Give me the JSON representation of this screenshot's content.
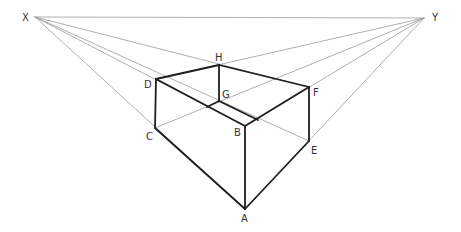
{
  "colors": {
    "construction": "#9a9a9a",
    "edge": "#1e1e1e",
    "label": "#333333"
  },
  "points": {
    "X": [
      35,
      17
    ],
    "Y": [
      424,
      18
    ],
    "A": [
      245,
      209
    ],
    "B": [
      245,
      126
    ],
    "C": [
      155,
      128
    ],
    "D": [
      156,
      79
    ],
    "E": [
      309,
      141
    ],
    "F": [
      309,
      87
    ],
    "G": [
      219,
      101
    ],
    "H": [
      219,
      65
    ]
  },
  "labels": [
    {
      "text": "X",
      "x": 22,
      "y": 21
    },
    {
      "text": "Y",
      "x": 432,
      "y": 21
    },
    {
      "text": "H",
      "x": 215,
      "y": 61
    },
    {
      "text": "D",
      "x": 144,
      "y": 88
    },
    {
      "text": "G",
      "x": 222,
      "y": 98
    },
    {
      "text": "F",
      "x": 313,
      "y": 96
    },
    {
      "text": "C",
      "x": 146,
      "y": 140
    },
    {
      "text": "B",
      "x": 234,
      "y": 136
    },
    {
      "text": "E",
      "x": 311,
      "y": 154
    },
    {
      "text": "A",
      "x": 241,
      "y": 222
    }
  ],
  "construction_lines": [
    [
      "X",
      "Y"
    ],
    [
      "X",
      "F"
    ],
    [
      "X",
      "B"
    ],
    [
      "X",
      "E"
    ],
    [
      "X",
      "A"
    ],
    [
      "Y",
      "D"
    ],
    [
      "Y",
      "C"
    ],
    [
      "Y",
      "B"
    ],
    [
      "Y",
      "A"
    ]
  ],
  "edges": [
    [
      "D",
      "H"
    ],
    [
      "H",
      "F"
    ],
    [
      "H",
      "G"
    ],
    [
      "D",
      "B"
    ],
    [
      "F",
      "B"
    ],
    [
      "D",
      "C"
    ],
    [
      "B",
      "A"
    ],
    [
      "F",
      "E"
    ],
    [
      "C",
      "A"
    ],
    [
      "E",
      "A"
    ]
  ],
  "partial_edges": [
    {
      "from": [
        219,
        101
      ],
      "to": [
        207,
        107
      ]
    },
    {
      "from": [
        219,
        101
      ],
      "to": [
        258,
        120
      ]
    }
  ]
}
